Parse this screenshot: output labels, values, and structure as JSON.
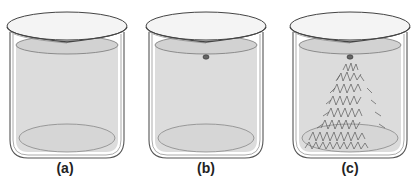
{
  "figure": {
    "panels": [
      {
        "id": "a",
        "label": "(a)",
        "description": "beaker with clear solution, no seed crystal",
        "has_seed": false,
        "has_crystals": false
      },
      {
        "id": "b",
        "label": "(b)",
        "description": "beaker with seed crystal added at surface",
        "has_seed": true,
        "has_crystals": false
      },
      {
        "id": "c",
        "label": "(c)",
        "description": "beaker with crystals growing from seed",
        "has_seed": true,
        "has_crystals": true
      }
    ]
  },
  "colors": {
    "background": "#ffffff",
    "solution": "#dcdcdc",
    "solution_surface": "#d0d0d0",
    "glass_outline": "#555555",
    "crystal": "#6a6a6a",
    "label": "#222222"
  }
}
